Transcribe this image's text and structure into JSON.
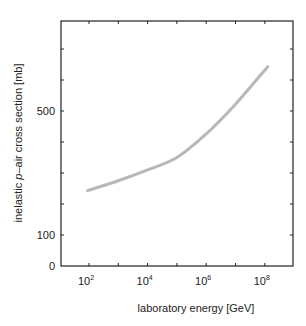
{
  "chart_data": {
    "type": "line",
    "title": "",
    "xlabel": "laboratory energy [GeV]",
    "ylabel_parts": {
      "pre": "inelastic ",
      "italic": "p",
      "post": "–air cross section [mb]"
    },
    "ylabel": "inelastic p–air cross section [mb]",
    "x_scale": "log",
    "xlim_log10": [
      1.0,
      9.0
    ],
    "ylim": [
      0,
      790
    ],
    "x_ticks_log10": [
      1,
      2,
      3,
      4,
      5,
      6,
      7,
      8,
      9
    ],
    "x_tick_labels": [
      {
        "log10": 2,
        "base": "10",
        "exp": "2"
      },
      {
        "log10": 4,
        "base": "10",
        "exp": "4"
      },
      {
        "log10": 6,
        "base": "10",
        "exp": "6"
      },
      {
        "log10": 8,
        "base": "10",
        "exp": "8"
      }
    ],
    "y_ticks": [
      0,
      100,
      200,
      300,
      400,
      500,
      600,
      700
    ],
    "y_tick_labels": [
      "0",
      "100",
      "500"
    ],
    "grid": false,
    "legend": null,
    "series": [
      {
        "name": "inelastic p-air cross section",
        "color": "#b8b8b8",
        "x_log10": [
          1.95,
          3.0,
          4.0,
          5.0,
          6.0,
          7.0,
          8.1
        ],
        "y": [
          243,
          275,
          310,
          350,
          426,
          522,
          643
        ]
      }
    ]
  },
  "colors": {
    "frame": "#222222",
    "curve": "#b8b8b8",
    "background": "#ffffff"
  }
}
